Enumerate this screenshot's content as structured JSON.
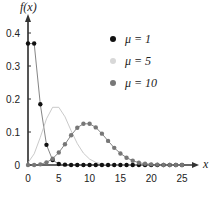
{
  "chart_data": {
    "type": "scatter",
    "title": "",
    "xlabel": "x",
    "ylabel": "f(x)",
    "xlim": [
      0,
      25
    ],
    "ylim": [
      0,
      0.4
    ],
    "x_ticks": [
      "0",
      "5",
      "10",
      "15",
      "20",
      "25"
    ],
    "y_ticks": [
      "0",
      "0.1",
      "0.2",
      "0.3",
      "0.4"
    ],
    "x": [
      0,
      1,
      2,
      3,
      4,
      5,
      6,
      7,
      8,
      9,
      10,
      11,
      12,
      13,
      14,
      15,
      16,
      17,
      18,
      19,
      20,
      21,
      22,
      23,
      24,
      25
    ],
    "series": [
      {
        "name": "μ = 1",
        "color": "#111111",
        "values": [
          0.368,
          0.368,
          0.184,
          0.061,
          0.015,
          0.003,
          0.001,
          0,
          0,
          0,
          0,
          0,
          0,
          0,
          0,
          0,
          0,
          0,
          0,
          0,
          0,
          0,
          0,
          0,
          0,
          0
        ]
      },
      {
        "name": "μ = 5",
        "color": "#d8d8d8",
        "values": [
          0.007,
          0.034,
          0.084,
          0.14,
          0.175,
          0.175,
          0.146,
          0.104,
          0.065,
          0.036,
          0.018,
          0.008,
          0.003,
          0.001,
          0,
          0,
          0,
          0,
          0,
          0,
          0,
          0,
          0,
          0,
          0,
          0
        ]
      },
      {
        "name": "μ = 10",
        "color": "#777777",
        "values": [
          0,
          0,
          0.002,
          0.008,
          0.019,
          0.038,
          0.063,
          0.09,
          0.113,
          0.125,
          0.125,
          0.114,
          0.095,
          0.073,
          0.052,
          0.035,
          0.022,
          0.013,
          0.007,
          0.004,
          0.002,
          0.001,
          0,
          0,
          0,
          0
        ]
      }
    ],
    "legend_position": "upper right",
    "grid": false
  },
  "legend": [
    {
      "label": "μ = 1",
      "color": "#111111"
    },
    {
      "label": "μ = 5",
      "color": "#d8d8d8"
    },
    {
      "label": "μ = 10",
      "color": "#777777"
    }
  ],
  "axis": {
    "x_label": "x",
    "y_label": "f(x)"
  }
}
